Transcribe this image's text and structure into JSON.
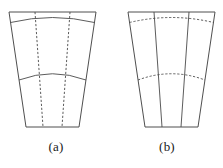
{
  "figure": {
    "background_color": "#ffffff",
    "line_color": "#4a4a4a",
    "panels": [
      {
        "id": "a",
        "caption": "(a)",
        "description": "annular sector mesh with solid circumferential arcs and dashed radial lines",
        "solid_feature": "arcs",
        "dashed_feature": "radial-lines",
        "outline": "M 9 12 L 96 12 L 79 127 L 26 127 Z",
        "arcs": [
          "M 10.5 22.5 Q 52.5 12.5 94.5 22.5",
          "M 19.0 80.0 Q 52.5 67.5 86.0 80.0"
        ],
        "radials": [
          "M 35.0 12 L 43.0 127",
          "M 70.0 12 L 62.0 127"
        ]
      },
      {
        "id": "b",
        "caption": "(b)",
        "description": "annular sector mesh with solid radial lines and dashed circumferential arcs",
        "solid_feature": "radial-lines",
        "dashed_feature": "arcs",
        "outline": "M 17 12 L 104 12 L 87 127 L 34 127 Z",
        "arcs": [
          "M 18.5 22.5 Q 60.5 12.5 102.5 22.5",
          "M 27.0 80.0 Q 60.5 67.5 94.0 80.0"
        ],
        "radials": [
          "M 43.0 12 L 51.0 127",
          "M 78.0 12 L 70.0 127"
        ]
      }
    ]
  }
}
